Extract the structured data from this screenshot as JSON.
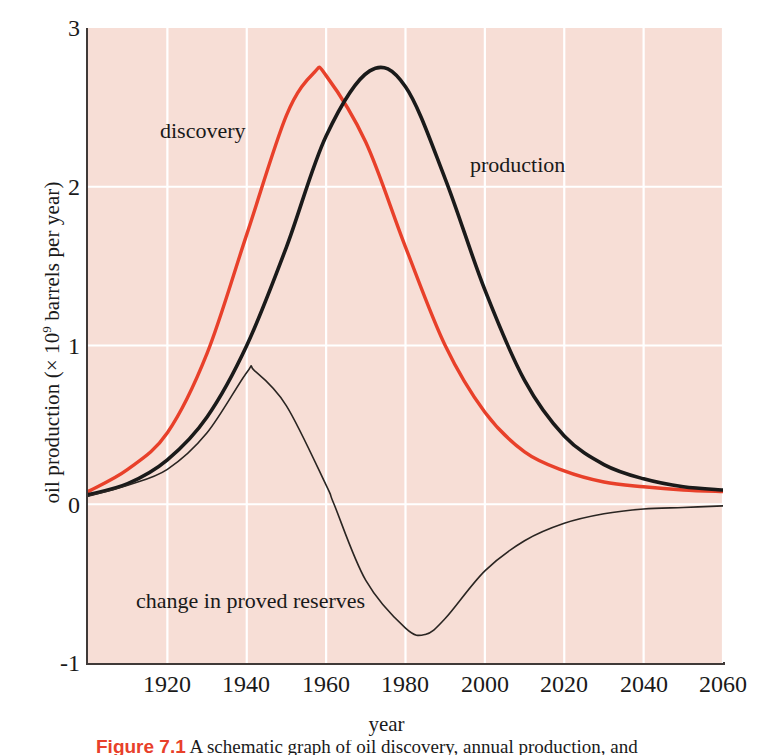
{
  "figure": {
    "background": "#ffffff",
    "plot_background": "#f7ded6",
    "grid_color": "#ffffff",
    "axis_color": "#403a38"
  },
  "labels": {
    "ylabel_prefix": "oil production (× 10",
    "ylabel_exponent": "9",
    "ylabel_suffix": " barrels per year)",
    "xlabel": "year",
    "discovery": "discovery",
    "production": "production",
    "reserves": "change in proved reserves"
  },
  "caption": {
    "figure_number": "Figure 7.1",
    "text": "A schematic graph of oil discovery, annual production, and"
  },
  "chart_data": {
    "type": "line",
    "title": "",
    "xlabel": "year",
    "ylabel": "oil production (× 10^9 barrels per year)",
    "xlim": [
      1900,
      2060
    ],
    "ylim": [
      -1,
      3
    ],
    "xticks": [
      1920,
      1940,
      1960,
      1980,
      2000,
      2020,
      2040,
      2060
    ],
    "yticks": [
      -1,
      0,
      1,
      2,
      3
    ],
    "grid": true,
    "legend": "inline-annotations",
    "series": [
      {
        "name": "discovery",
        "color": "#e8402a",
        "linewidth": 3.4,
        "peak_year": 1957,
        "peak_value": 2.72,
        "x": [
          1900,
          1910,
          1920,
          1930,
          1940,
          1950,
          1957,
          1960,
          1970,
          1980,
          1990,
          2000,
          2010,
          2020,
          2030,
          2040,
          2050,
          2060
        ],
        "y": [
          0.08,
          0.22,
          0.45,
          0.95,
          1.7,
          2.45,
          2.72,
          2.7,
          2.28,
          1.62,
          1.0,
          0.58,
          0.33,
          0.21,
          0.14,
          0.11,
          0.09,
          0.08
        ]
      },
      {
        "name": "production",
        "color": "#1a1a1a",
        "linewidth": 3.6,
        "peak_year": 1971,
        "peak_value": 2.73,
        "x": [
          1900,
          1910,
          1920,
          1930,
          1940,
          1950,
          1960,
          1971,
          1980,
          1990,
          2000,
          2010,
          2020,
          2030,
          2040,
          2050,
          2060
        ],
        "y": [
          0.06,
          0.13,
          0.28,
          0.55,
          1.0,
          1.62,
          2.32,
          2.73,
          2.63,
          2.05,
          1.35,
          0.78,
          0.43,
          0.25,
          0.16,
          0.11,
          0.09
        ]
      },
      {
        "name": "change in proved reserves",
        "color": "#2a2522",
        "linewidth": 1.6,
        "peak_year": 1942,
        "peak_value": 0.84,
        "zero_crossing_year": 1962,
        "trough_year": 1985,
        "trough_value": -0.82,
        "x": [
          1900,
          1910,
          1920,
          1930,
          1940,
          1942,
          1950,
          1960,
          1962,
          1970,
          1980,
          1985,
          1990,
          2000,
          2010,
          2020,
          2030,
          2040,
          2050,
          2060
        ],
        "y": [
          0.05,
          0.12,
          0.22,
          0.45,
          0.83,
          0.84,
          0.62,
          0.12,
          0.0,
          -0.48,
          -0.78,
          -0.82,
          -0.72,
          -0.42,
          -0.23,
          -0.12,
          -0.06,
          -0.03,
          -0.02,
          -0.01
        ]
      }
    ]
  }
}
